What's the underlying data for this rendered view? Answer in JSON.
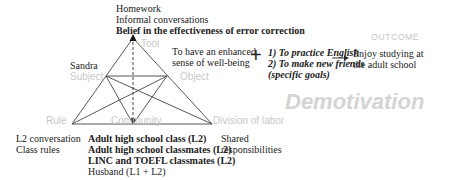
{
  "tool": {
    "label": "Tool",
    "items": [
      {
        "text": "Homework",
        "bold": false
      },
      {
        "text": "Informal conversations",
        "bold": false
      },
      {
        "text": "Belief in the effectiveness of error correction",
        "bold": true
      }
    ]
  },
  "subject": {
    "label": "Subject",
    "value": "Sandra"
  },
  "object": {
    "label": "Object",
    "lines": [
      "To have an enhanced",
      "sense of well-being"
    ]
  },
  "goals": {
    "lines": [
      "1) To practice English",
      "2) To make new friends",
      "(specific goals)"
    ],
    "plus_symbol": "+"
  },
  "outcome": {
    "label": "OUTCOME",
    "lines": [
      "Enjoy studying at",
      "the adult school"
    ]
  },
  "rule": {
    "label": "Rule",
    "items": [
      "L2 conversation",
      "Class rules"
    ]
  },
  "community": {
    "label": "Community",
    "items": [
      {
        "text": "Adult high school class (L2)",
        "bold": true
      },
      {
        "text": "Adult high school classmates (L2)",
        "bold": true
      },
      {
        "text": "LINC and TOEFL classmates (L2)",
        "bold": true
      },
      {
        "text": "Husband (L1 + L2)",
        "bold": false
      }
    ]
  },
  "division_of_labor": {
    "label": "Division of labor",
    "lines": [
      "Shared",
      "responsibilities"
    ]
  },
  "watermark": {
    "text": "Demotivation"
  },
  "colors": {
    "line": "#333333",
    "node_label": "#c8c8c8",
    "watermark": "#d4d4d4"
  }
}
